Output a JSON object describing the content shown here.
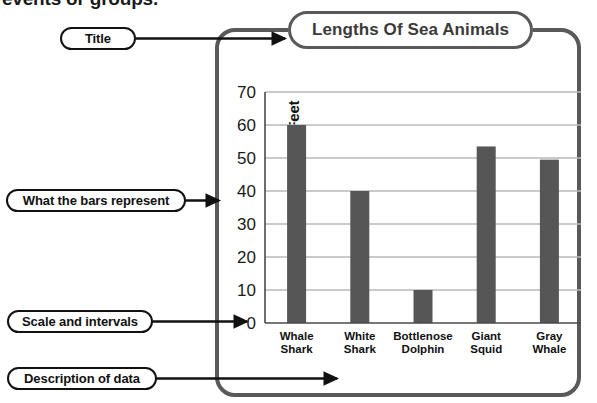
{
  "page": {
    "cutoff_text": "events or groups."
  },
  "chart_title_box": {
    "label": "Lengths Of Sea Animals"
  },
  "callouts": [
    {
      "id": "title",
      "label": "Title"
    },
    {
      "id": "bars",
      "label": "What the bars represent"
    },
    {
      "id": "scale",
      "label": "Scale and intervals"
    },
    {
      "id": "description",
      "label": "Description of data"
    }
  ],
  "axis": {
    "x_label": "Animal",
    "y_label": "Length in Feet"
  },
  "colors": {
    "bar": "#565656",
    "frame": "#595959",
    "callout_border": "#111111",
    "gridline": "#b8b8b8",
    "axis": "#4a4a4a",
    "title_text": "#3a3a3a"
  },
  "chart_data": {
    "type": "bar",
    "title": "Lengths Of Sea Animals",
    "xlabel": "Animal",
    "ylabel": "Length in Feet",
    "categories": [
      "Whale Shark",
      "White Shark",
      "Bottlenose Dolphin",
      "Giant Squid",
      "Gray Whale"
    ],
    "category_lines": [
      [
        "Whale",
        "Shark"
      ],
      [
        "White",
        "Shark"
      ],
      [
        "Bottlenose",
        "Dolphin"
      ],
      [
        "Giant",
        "Squid"
      ],
      [
        "Gray",
        "Whale"
      ]
    ],
    "values": [
      60,
      40,
      10,
      53.5,
      49.5
    ],
    "ylim": [
      0,
      70
    ],
    "yticks": [
      0,
      10,
      20,
      30,
      40,
      50,
      60,
      70
    ],
    "ytick_labels": [
      "0",
      "10",
      "20",
      "30",
      "40",
      "50",
      "60",
      "70"
    ],
    "grid": true,
    "legend": null,
    "orientation": "vertical"
  }
}
